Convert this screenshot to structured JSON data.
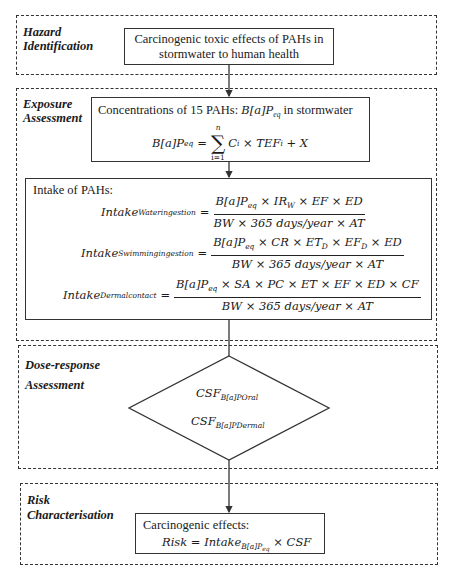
{
  "sections": [
    {
      "id": "hazard",
      "label": "Hazard\nIdentification"
    },
    {
      "id": "exposure",
      "label": "Exposure\nAssessment"
    },
    {
      "id": "dose",
      "label": "Dose-response\nAssessment"
    },
    {
      "id": "risk",
      "label": "Risk\nCharacterisation"
    }
  ],
  "hazard_box": {
    "line1": "Carcinogenic toxic effects of PAHs in",
    "line2": "stormwater to human health"
  },
  "concentration_box": {
    "title_prefix": "Concentrations of 15 PAHs: ",
    "title_math": "B[a]P",
    "title_math_sub": "eq",
    "title_suffix": " in stormwater",
    "eq_lhs": "B[a]P",
    "eq_lhs_sub": "eq",
    "eq_sum_upper": "n",
    "eq_sum_lower": "i=1",
    "eq_rhs": "C",
    "eq_rhs_sub": "i",
    "eq_rhs_mid": " × TEF",
    "eq_rhs_sub2": "i",
    "eq_rhs_end": " + X"
  },
  "intake_box": {
    "title": "Intake of PAHs:",
    "equations": [
      {
        "lhs": "Intake",
        "lhs_sub": "Wateringestion",
        "num": "B[a]P_eq × IR_W × EF × ED",
        "num_parts": [
          "B[a]P",
          "eq",
          " × IR",
          "W",
          " × EF × ED"
        ],
        "den": "BW × 365 days/year × AT"
      },
      {
        "lhs": "Intake",
        "lhs_sub": "Swimmingingestion",
        "num": "B[a]P_eq × CR × ET_D × EF_D × ED",
        "num_parts": [
          "B[a]P",
          "eq",
          " × CR × ET",
          "D",
          " × EF",
          "D",
          " × ED"
        ],
        "den": "BW × 365 days/year × AT"
      },
      {
        "lhs": "Intake",
        "lhs_sub": "Dermalcontact",
        "num": "B[a]P_eq × SA × PC × ET × EF × ED × CF",
        "num_parts": [
          "B[a]P",
          "eq",
          " × SA × PC × ET × EF × ED × CF"
        ],
        "den": "BW × 365 days/year × AT"
      }
    ]
  },
  "dose_diamond": {
    "line1": "CSF",
    "line1_sub": "B[a]POral",
    "line2": "CSF",
    "line2_sub": "B[a]PDermal"
  },
  "risk_box": {
    "title": "Carcinogenic effects:",
    "formula_lhs": "Risk = Intake",
    "formula_sub": "B[a]P",
    "formula_subsub": "eq",
    "formula_rhs": " × CSF"
  },
  "colors": {
    "line": "#333333",
    "background": "#ffffff",
    "text": "#1a1a1a"
  }
}
